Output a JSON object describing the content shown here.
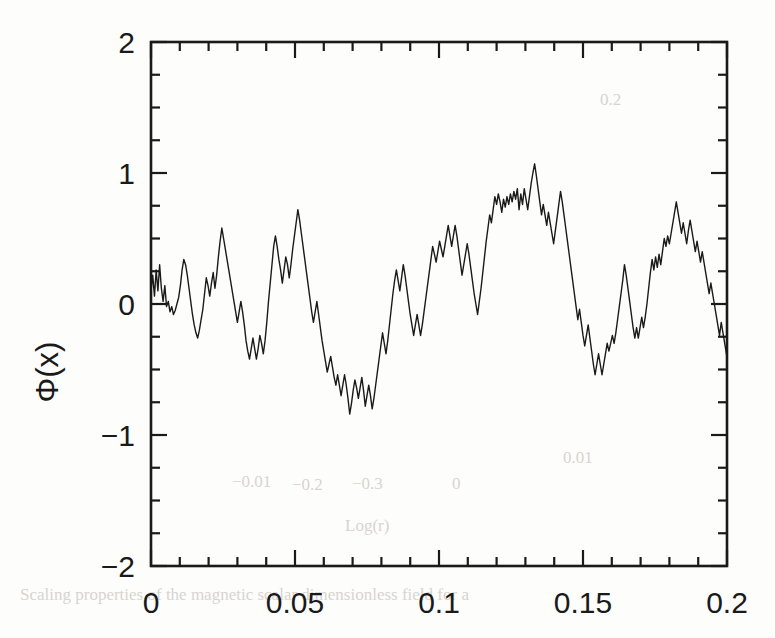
{
  "figure": {
    "background_color": "#fdfdfc",
    "ink_color": "#1a1a1a",
    "frame": {
      "left": 151,
      "right": 727,
      "top": 42,
      "bottom": 566
    }
  },
  "axes": {
    "y_title": "Φ(x)",
    "x_title": "",
    "x_tick_labels": [
      "0",
      "0.05",
      "0.1",
      "0.15",
      "0.2"
    ],
    "y_tick_labels": [
      "2",
      "1",
      "0",
      "−1",
      "−2"
    ]
  },
  "bleedthrough": {
    "note": "faint show-through text from reverse page",
    "items": [
      {
        "text": "0.01",
        "x": 563,
        "y": 463,
        "size": 17
      },
      {
        "text": "−0.01",
        "x": 232,
        "y": 487,
        "size": 16
      },
      {
        "text": "−0.2",
        "x": 292,
        "y": 490,
        "size": 16
      },
      {
        "text": "−0.3",
        "x": 352,
        "y": 489,
        "size": 16
      },
      {
        "text": "0",
        "x": 452,
        "y": 489,
        "size": 16
      },
      {
        "text": "Log(r)",
        "x": 345,
        "y": 531,
        "size": 18
      },
      {
        "text": "0.2",
        "x": 600,
        "y": 105,
        "size": 17
      },
      {
        "text": "Scaling properties of the magnetic scalar dimensionless field for a",
        "x": 20,
        "y": 600,
        "size": 17
      }
    ]
  },
  "chart_data": {
    "type": "line",
    "title": "",
    "xlabel": "",
    "ylabel": "Φ(x)",
    "xlim": [
      0,
      0.2
    ],
    "ylim": [
      -2,
      2
    ],
    "grid": false,
    "legend": null,
    "x_major_ticks": [
      0,
      0.05,
      0.1,
      0.15,
      0.2
    ],
    "x_minor_step": 0.01,
    "y_major_ticks": [
      -2,
      -1,
      0,
      1,
      2
    ],
    "y_minor_step": 0.25,
    "ticks_direction": "in",
    "series": [
      {
        "name": "Φ(x)",
        "color": "#1a1a1a",
        "linewidth": 1.4,
        "x": [
          0.0,
          0.0006,
          0.0012,
          0.0018,
          0.0024,
          0.003,
          0.0036,
          0.0042,
          0.0048,
          0.0054,
          0.006,
          0.0066,
          0.0072,
          0.0078,
          0.0084,
          0.009,
          0.0096,
          0.0102,
          0.0108,
          0.0114,
          0.012,
          0.0126,
          0.0132,
          0.0138,
          0.0144,
          0.015,
          0.0156,
          0.0162,
          0.0168,
          0.0174,
          0.018,
          0.0186,
          0.0192,
          0.0198,
          0.0204,
          0.021,
          0.0216,
          0.0222,
          0.0228,
          0.0234,
          0.024,
          0.0246,
          0.0252,
          0.0258,
          0.0264,
          0.027,
          0.0276,
          0.0282,
          0.0288,
          0.0294,
          0.03,
          0.0306,
          0.0312,
          0.0318,
          0.0324,
          0.033,
          0.0336,
          0.0342,
          0.0348,
          0.0354,
          0.036,
          0.0366,
          0.0372,
          0.0378,
          0.0384,
          0.039,
          0.0396,
          0.0402,
          0.0408,
          0.0414,
          0.042,
          0.0426,
          0.0432,
          0.0438,
          0.0444,
          0.045,
          0.0456,
          0.0462,
          0.0468,
          0.0474,
          0.048,
          0.0486,
          0.0492,
          0.0498,
          0.0504,
          0.051,
          0.0516,
          0.0522,
          0.0528,
          0.0534,
          0.054,
          0.0546,
          0.0552,
          0.0558,
          0.0564,
          0.057,
          0.0576,
          0.0582,
          0.0588,
          0.0594,
          0.06,
          0.0606,
          0.0612,
          0.0618,
          0.0624,
          0.063,
          0.0636,
          0.0642,
          0.0648,
          0.0654,
          0.066,
          0.0666,
          0.0672,
          0.0678,
          0.0684,
          0.069,
          0.0696,
          0.0702,
          0.0708,
          0.0714,
          0.072,
          0.0726,
          0.0732,
          0.0738,
          0.0744,
          0.075,
          0.0756,
          0.0762,
          0.0768,
          0.0774,
          0.078,
          0.0786,
          0.0792,
          0.0798,
          0.0804,
          0.081,
          0.0816,
          0.0822,
          0.0828,
          0.0834,
          0.084,
          0.0846,
          0.0852,
          0.0858,
          0.0864,
          0.087,
          0.0876,
          0.0882,
          0.0888,
          0.0894,
          0.09,
          0.0906,
          0.0912,
          0.0918,
          0.0924,
          0.093,
          0.0936,
          0.0942,
          0.0948,
          0.0954,
          0.096,
          0.0966,
          0.0972,
          0.0978,
          0.0984,
          0.099,
          0.0996,
          0.1002,
          0.1008,
          0.1014,
          0.102,
          0.1026,
          0.1032,
          0.1038,
          0.1044,
          0.105,
          0.1056,
          0.1062,
          0.1068,
          0.1074,
          0.108,
          0.1086,
          0.1092,
          0.1098,
          0.1104,
          0.111,
          0.1116,
          0.1122,
          0.1128,
          0.1134,
          0.114,
          0.1146,
          0.1152,
          0.1158,
          0.1164,
          0.117,
          0.1176,
          0.1182,
          0.1188,
          0.1194,
          0.12,
          0.1206,
          0.1212,
          0.1218,
          0.1224,
          0.123,
          0.1236,
          0.1242,
          0.1248,
          0.1254,
          0.126,
          0.1266,
          0.1272,
          0.1278,
          0.1284,
          0.129,
          0.1296,
          0.1302,
          0.1308,
          0.1314,
          0.132,
          0.1326,
          0.1332,
          0.1338,
          0.1344,
          0.135,
          0.1356,
          0.1362,
          0.1368,
          0.1374,
          0.138,
          0.1386,
          0.1392,
          0.1398,
          0.1404,
          0.141,
          0.1416,
          0.1422,
          0.1428,
          0.1434,
          0.144,
          0.1446,
          0.1452,
          0.1458,
          0.1464,
          0.147,
          0.1476,
          0.1482,
          0.1488,
          0.1494,
          0.15,
          0.1506,
          0.1512,
          0.1518,
          0.1524,
          0.153,
          0.1536,
          0.1542,
          0.1548,
          0.1554,
          0.156,
          0.1566,
          0.1572,
          0.1578,
          0.1584,
          0.159,
          0.1596,
          0.1602,
          0.1608,
          0.1614,
          0.162,
          0.1626,
          0.1632,
          0.1638,
          0.1644,
          0.165,
          0.1656,
          0.1662,
          0.1668,
          0.1674,
          0.168,
          0.1686,
          0.1692,
          0.1698,
          0.1704,
          0.171,
          0.1716,
          0.1722,
          0.1728,
          0.1734,
          0.174,
          0.1746,
          0.1752,
          0.1758,
          0.1764,
          0.177,
          0.1776,
          0.1782,
          0.1788,
          0.1794,
          0.18,
          0.1806,
          0.1812,
          0.1818,
          0.1824,
          0.183,
          0.1836,
          0.1842,
          0.1848,
          0.1854,
          0.186,
          0.1866,
          0.1872,
          0.1878,
          0.1884,
          0.189,
          0.1896,
          0.1902,
          0.1908,
          0.1914,
          0.192,
          0.1926,
          0.1932,
          0.1938,
          0.1944,
          0.195,
          0.1956,
          0.1962,
          0.1968,
          0.1974,
          0.198,
          0.1986,
          0.1992,
          0.1998,
          0.2
        ],
        "y": [
          0.1,
          0.22,
          0.06,
          0.26,
          0.1,
          0.3,
          0.12,
          0.02,
          0.14,
          -0.02,
          0.02,
          -0.06,
          -0.02,
          -0.08,
          -0.05,
          0.0,
          0.05,
          0.14,
          0.26,
          0.34,
          0.3,
          0.22,
          0.12,
          0.02,
          -0.08,
          -0.16,
          -0.22,
          -0.26,
          -0.2,
          -0.12,
          -0.04,
          0.08,
          0.2,
          0.14,
          0.06,
          0.16,
          0.24,
          0.12,
          0.22,
          0.36,
          0.48,
          0.58,
          0.5,
          0.42,
          0.34,
          0.26,
          0.18,
          0.1,
          0.02,
          -0.06,
          -0.14,
          -0.06,
          0.02,
          -0.06,
          -0.16,
          -0.28,
          -0.36,
          -0.42,
          -0.34,
          -0.26,
          -0.34,
          -0.42,
          -0.34,
          -0.24,
          -0.3,
          -0.38,
          -0.28,
          -0.14,
          0.02,
          0.16,
          0.3,
          0.44,
          0.52,
          0.44,
          0.34,
          0.26,
          0.16,
          0.26,
          0.36,
          0.3,
          0.2,
          0.3,
          0.42,
          0.52,
          0.62,
          0.72,
          0.64,
          0.54,
          0.44,
          0.34,
          0.24,
          0.14,
          0.04,
          -0.06,
          -0.14,
          -0.06,
          0.02,
          -0.08,
          -0.18,
          -0.28,
          -0.36,
          -0.44,
          -0.52,
          -0.46,
          -0.4,
          -0.48,
          -0.56,
          -0.62,
          -0.54,
          -0.62,
          -0.7,
          -0.62,
          -0.54,
          -0.62,
          -0.72,
          -0.84,
          -0.76,
          -0.66,
          -0.58,
          -0.64,
          -0.72,
          -0.64,
          -0.56,
          -0.66,
          -0.78,
          -0.7,
          -0.62,
          -0.7,
          -0.8,
          -0.72,
          -0.62,
          -0.52,
          -0.42,
          -0.32,
          -0.22,
          -0.3,
          -0.38,
          -0.28,
          -0.16,
          -0.04,
          0.08,
          0.18,
          0.26,
          0.18,
          0.1,
          0.2,
          0.3,
          0.22,
          0.12,
          0.02,
          -0.08,
          -0.16,
          -0.24,
          -0.16,
          -0.08,
          -0.16,
          -0.24,
          -0.16,
          -0.06,
          0.04,
          0.14,
          0.24,
          0.34,
          0.44,
          0.38,
          0.32,
          0.4,
          0.48,
          0.42,
          0.36,
          0.44,
          0.52,
          0.6,
          0.52,
          0.44,
          0.52,
          0.6,
          0.52,
          0.42,
          0.32,
          0.22,
          0.3,
          0.38,
          0.46,
          0.38,
          0.28,
          0.18,
          0.08,
          0.0,
          -0.08,
          0.02,
          0.12,
          0.24,
          0.36,
          0.48,
          0.58,
          0.68,
          0.62,
          0.72,
          0.82,
          0.76,
          0.84,
          0.78,
          0.7,
          0.8,
          0.74,
          0.82,
          0.76,
          0.84,
          0.78,
          0.86,
          0.8,
          0.88,
          0.72,
          0.84,
          0.76,
          0.88,
          0.8,
          0.72,
          0.82,
          0.92,
          1.0,
          1.07,
          0.98,
          0.88,
          0.78,
          0.68,
          0.76,
          0.68,
          0.6,
          0.7,
          0.62,
          0.54,
          0.46,
          0.56,
          0.66,
          0.76,
          0.86,
          0.78,
          0.68,
          0.58,
          0.48,
          0.38,
          0.28,
          0.18,
          0.08,
          -0.02,
          -0.12,
          -0.04,
          -0.14,
          -0.24,
          -0.32,
          -0.24,
          -0.16,
          -0.26,
          -0.36,
          -0.46,
          -0.54,
          -0.46,
          -0.38,
          -0.46,
          -0.54,
          -0.46,
          -0.38,
          -0.3,
          -0.36,
          -0.3,
          -0.24,
          -0.3,
          -0.22,
          -0.12,
          -0.02,
          0.08,
          0.18,
          0.3,
          0.22,
          0.12,
          0.02,
          -0.08,
          -0.18,
          -0.26,
          -0.18,
          -0.26,
          -0.18,
          -0.1,
          -0.18,
          -0.1,
          0.0,
          0.12,
          0.24,
          0.34,
          0.26,
          0.36,
          0.28,
          0.38,
          0.3,
          0.4,
          0.5,
          0.44,
          0.52,
          0.46,
          0.54,
          0.62,
          0.7,
          0.78,
          0.7,
          0.62,
          0.54,
          0.62,
          0.54,
          0.46,
          0.56,
          0.64,
          0.56,
          0.48,
          0.4,
          0.48,
          0.4,
          0.32,
          0.4,
          0.32,
          0.24,
          0.16,
          0.08,
          0.16,
          0.08,
          0.0,
          -0.08,
          -0.16,
          -0.24,
          -0.14,
          -0.22,
          -0.3,
          -0.38,
          -0.42
        ]
      }
    ]
  }
}
